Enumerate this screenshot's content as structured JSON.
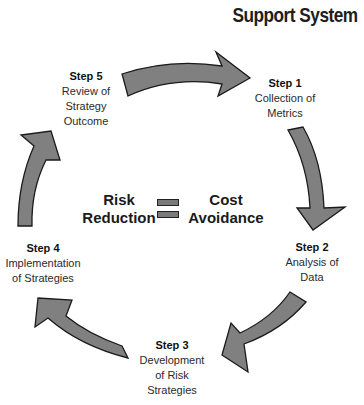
{
  "title": "Support System",
  "center": {
    "left_text": [
      "Risk",
      "Reduction"
    ],
    "right_text": [
      "Cost",
      "Avoidance"
    ],
    "operator": "equals-icon"
  },
  "steps": [
    {
      "label": "Step 1",
      "lines": [
        "Collection of",
        "Metrics"
      ]
    },
    {
      "label": "Step 2",
      "lines": [
        "Analysis of",
        "Data"
      ]
    },
    {
      "label": "Step 3",
      "lines": [
        "Development",
        "of Risk",
        "Strategies"
      ]
    },
    {
      "label": "Step 4",
      "lines": [
        "Implementation",
        "of Strategies"
      ]
    },
    {
      "label": "Step 5",
      "lines": [
        "Review of",
        "Strategy",
        "Outcome"
      ]
    }
  ],
  "colors": {
    "arrow_fill": "#808080",
    "arrow_stroke": "#1a1a1a"
  }
}
